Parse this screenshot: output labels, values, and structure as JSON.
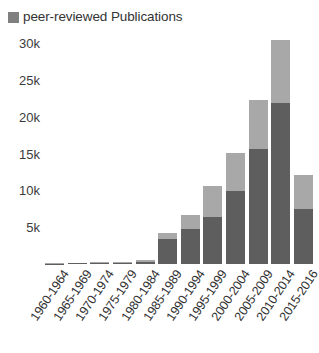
{
  "legend": {
    "position": "top-left",
    "entries": [
      {
        "label": "peer-reviewed Publications",
        "color": "#808080",
        "icon": "square-swatch-icon"
      }
    ]
  },
  "colors": {
    "series_lower": "#5e5e5e",
    "series_upper": "#a8a8a8",
    "legend_swatch": "#808080",
    "text": "#333333",
    "background": "#ffffff"
  },
  "chart_data": {
    "type": "bar",
    "stacked": true,
    "title": "",
    "subtitle": "",
    "xlabel": "",
    "ylabel": "",
    "grid": false,
    "legend_position": "top-left",
    "ylim": [
      0,
      31000
    ],
    "ytick_labels": [
      "5k",
      "10k",
      "15k",
      "20k",
      "25k",
      "30k"
    ],
    "ytick_values": [
      5000,
      10000,
      15000,
      20000,
      25000,
      30000
    ],
    "categories": [
      "1960-1964",
      "1965-1969",
      "1970-1974",
      "1975-1979",
      "1980-1984",
      "1985-1989",
      "1990-1994",
      "1995-1999",
      "2000-2004",
      "2005-2009",
      "2010-2014",
      "2015-2016"
    ],
    "series": [
      {
        "name": "peer-reviewed Publications",
        "color": "#5e5e5e",
        "stack_position": "lower",
        "values": [
          60,
          80,
          120,
          180,
          300,
          3400,
          4800,
          6400,
          9900,
          15600,
          21900,
          7500
        ]
      },
      {
        "name": "other Publications",
        "color": "#a8a8a8",
        "stack_position": "upper",
        "values": [
          40,
          60,
          90,
          140,
          250,
          800,
          1800,
          4200,
          5200,
          6700,
          8500,
          4600
        ]
      }
    ],
    "totals": [
      100,
      140,
      210,
      320,
      550,
      4200,
      6600,
      10600,
      15100,
      22300,
      30400,
      12100
    ]
  }
}
